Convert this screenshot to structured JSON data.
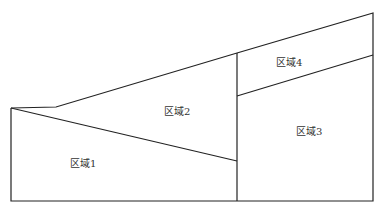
{
  "diagram": {
    "regions": [
      {
        "id": "region-1",
        "label": "区域1",
        "x": 83,
        "y": 167
      },
      {
        "id": "region-2",
        "label": "区域2",
        "x": 177,
        "y": 115
      },
      {
        "id": "region-3",
        "label": "区域3",
        "x": 308,
        "y": 135
      },
      {
        "id": "region-4",
        "label": "区域4",
        "x": 290,
        "y": 65
      }
    ],
    "line_color": "#222222"
  }
}
